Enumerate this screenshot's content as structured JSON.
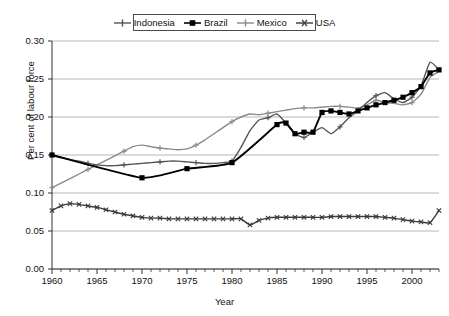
{
  "chart_data": {
    "type": "line",
    "title": "",
    "xlabel": "Year",
    "ylabel": "Per cent of labour force",
    "xlim": [
      1960,
      2003
    ],
    "ylim": [
      0.0,
      0.3
    ],
    "ytick_labels": [
      "0.00",
      "0.05",
      "0.10",
      "0.15",
      "0.20",
      "0.25",
      "0.30"
    ],
    "ytick_values": [
      0.0,
      0.05,
      0.1,
      0.15,
      0.2,
      0.25,
      0.3
    ],
    "xtick_labels": [
      "1960",
      "1965",
      "1970",
      "1975",
      "1980",
      "1985",
      "1990",
      "1995",
      "2000"
    ],
    "xtick_values": [
      1960,
      1965,
      1970,
      1975,
      1980,
      1985,
      1990,
      1995,
      2000
    ],
    "minor_xticks_every": 1,
    "grid": "horizontal",
    "legend_position": "top-center",
    "legend_entries": [
      "Indonesia",
      "Brazil",
      "Mexico",
      "USA"
    ],
    "series": [
      {
        "name": "Indonesia",
        "color": "#555555",
        "marker": "plus",
        "x": [
          1960,
          1961,
          1962,
          1963,
          1964,
          1965,
          1966,
          1967,
          1968,
          1969,
          1970,
          1971,
          1972,
          1973,
          1974,
          1975,
          1976,
          1977,
          1978,
          1979,
          1980,
          1981,
          1982,
          1983,
          1984,
          1985,
          1986,
          1987,
          1988,
          1989,
          1990,
          1991,
          1992,
          1993,
          1994,
          1995,
          1996,
          1997,
          1998,
          1999,
          2000,
          2001,
          2002,
          2003
        ],
        "values": [
          0.15,
          0.147,
          0.144,
          0.142,
          0.139,
          0.137,
          0.136,
          0.136,
          0.137,
          0.138,
          0.139,
          0.14,
          0.141,
          0.142,
          0.142,
          0.141,
          0.14,
          0.139,
          0.139,
          0.14,
          0.142,
          0.16,
          0.182,
          0.196,
          0.199,
          0.204,
          0.192,
          0.178,
          0.173,
          0.18,
          0.186,
          0.178,
          0.187,
          0.199,
          0.208,
          0.219,
          0.228,
          0.232,
          0.224,
          0.219,
          0.226,
          0.241,
          0.272,
          0.262
        ]
      },
      {
        "name": "Brazil",
        "color": "#000000",
        "marker": "square",
        "x": [
          1960,
          1970,
          1975,
          1980,
          1985,
          1986,
          1987,
          1988,
          1989,
          1990,
          1991,
          1992,
          1993,
          1994,
          1995,
          1996,
          1997,
          1998,
          1999,
          2000,
          2001,
          2002,
          2003
        ],
        "values": [
          0.15,
          0.12,
          0.132,
          0.14,
          0.19,
          0.192,
          0.178,
          0.18,
          0.18,
          0.206,
          0.208,
          0.206,
          0.204,
          0.208,
          0.212,
          0.216,
          0.219,
          0.222,
          0.226,
          0.232,
          0.24,
          0.258,
          0.262
        ]
      },
      {
        "name": "Mexico",
        "color": "#8a8a8a",
        "marker": "plus",
        "x": [
          1960,
          1961,
          1962,
          1963,
          1964,
          1965,
          1966,
          1967,
          1968,
          1969,
          1970,
          1971,
          1972,
          1973,
          1974,
          1975,
          1976,
          1977,
          1978,
          1979,
          1980,
          1981,
          1982,
          1983,
          1984,
          1985,
          1986,
          1987,
          1988,
          1989,
          1990,
          1991,
          1992,
          1993,
          1994,
          1995,
          1996,
          1997,
          1998,
          1999,
          2000,
          2001,
          2002,
          2003
        ],
        "values": [
          0.107,
          0.113,
          0.119,
          0.125,
          0.131,
          0.137,
          0.143,
          0.149,
          0.155,
          0.161,
          0.163,
          0.161,
          0.159,
          0.158,
          0.157,
          0.158,
          0.163,
          0.17,
          0.178,
          0.186,
          0.194,
          0.2,
          0.204,
          0.203,
          0.205,
          0.207,
          0.209,
          0.211,
          0.212,
          0.212,
          0.213,
          0.214,
          0.214,
          0.213,
          0.212,
          0.216,
          0.222,
          0.219,
          0.218,
          0.216,
          0.219,
          0.23,
          0.252,
          0.26
        ]
      },
      {
        "name": "USA",
        "color": "#3a3a3a",
        "marker": "x",
        "x": [
          1960,
          1961,
          1962,
          1963,
          1964,
          1965,
          1966,
          1967,
          1968,
          1969,
          1970,
          1971,
          1972,
          1973,
          1974,
          1975,
          1976,
          1977,
          1978,
          1979,
          1980,
          1981,
          1982,
          1983,
          1984,
          1985,
          1986,
          1987,
          1988,
          1989,
          1990,
          1991,
          1992,
          1993,
          1994,
          1995,
          1996,
          1997,
          1998,
          1999,
          2000,
          2001,
          2002,
          2003
        ],
        "values": [
          0.077,
          0.083,
          0.086,
          0.085,
          0.083,
          0.081,
          0.078,
          0.075,
          0.072,
          0.07,
          0.068,
          0.067,
          0.067,
          0.066,
          0.066,
          0.066,
          0.066,
          0.066,
          0.066,
          0.066,
          0.066,
          0.066,
          0.058,
          0.064,
          0.067,
          0.068,
          0.068,
          0.068,
          0.068,
          0.068,
          0.068,
          0.069,
          0.069,
          0.069,
          0.069,
          0.069,
          0.069,
          0.068,
          0.067,
          0.065,
          0.063,
          0.062,
          0.061,
          0.077
        ]
      }
    ]
  },
  "axes": {
    "y_title": "Per cent of labour force",
    "x_title": "Year"
  }
}
